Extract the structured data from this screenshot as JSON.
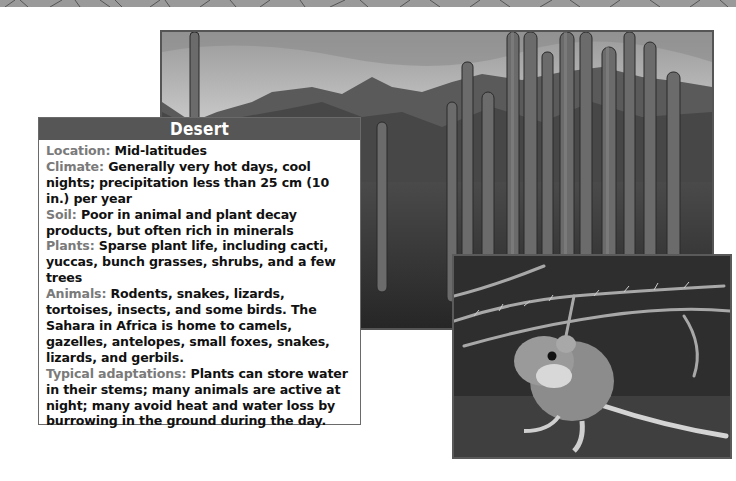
{
  "page": {
    "decorative_strip": "desert-crackle-texture"
  },
  "images": {
    "landscape": {
      "subject": "Organ pipe cacti in front of rocky desert mountains under a cloudy sky",
      "icon": "landscape-photo"
    },
    "animal": {
      "subject": "Kangaroo rat on desert ground beneath dry thorny branches",
      "icon": "kangaroo-rat-photo"
    }
  },
  "info_box": {
    "title": "Desert",
    "fields": [
      {
        "label": "Location:",
        "text": " Mid-latitudes"
      },
      {
        "label": "Climate:",
        "text": " Generally very hot days, cool nights; precipitation less than 25 cm (10 in.) per year"
      },
      {
        "label": "Soil:",
        "text": " Poor in animal and plant decay products, but often rich in minerals"
      },
      {
        "label": "Plants:",
        "text": " Sparse plant life, including cacti, yuccas, bunch grasses, shrubs, and a few trees"
      },
      {
        "label": "Animals:",
        "text": " Rodents, snakes, lizards, tortoises, insects, and some birds. The Sahara in Africa is home to camels, gazelles, antelopes, small foxes, snakes, lizards, and gerbils."
      },
      {
        "label": "Typical adaptations:",
        "text": " Plants can store water in their stems; many animals are active at night; many avoid heat and water loss by burrowing in the ground during the day."
      }
    ]
  },
  "colors": {
    "title_bar": "#565656",
    "label_gray": "#7a7a7a",
    "text": "#111111",
    "border": "#6a6a6a"
  }
}
